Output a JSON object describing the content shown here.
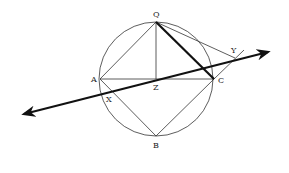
{
  "diagram": {
    "title": "",
    "points": {
      "Q": {
        "label": "Q",
        "x": 156,
        "y": 22
      },
      "A": {
        "label": "A",
        "x": 100,
        "y": 79
      },
      "C": {
        "label": "C",
        "x": 214,
        "y": 79
      },
      "B": {
        "label": "B",
        "x": 156,
        "y": 136
      },
      "Z": {
        "label": "Z",
        "x": 156,
        "y": 79
      },
      "X": {
        "label": "X",
        "x": 111,
        "y": 91
      },
      "Y": {
        "label": "Y",
        "x": 235,
        "y": 58
      }
    },
    "circle": {
      "cx": 156,
      "cy": 79,
      "r": 57
    },
    "segments": [
      "QA",
      "QZ",
      "QC",
      "QY",
      "AC",
      "AB",
      "BC",
      "CY"
    ],
    "bold_segments": [
      "QC"
    ],
    "line": {
      "through": [
        "X",
        "Y"
      ],
      "arrows": "both"
    },
    "colors": {
      "stroke": "#333333",
      "background": "#ffffff"
    }
  }
}
